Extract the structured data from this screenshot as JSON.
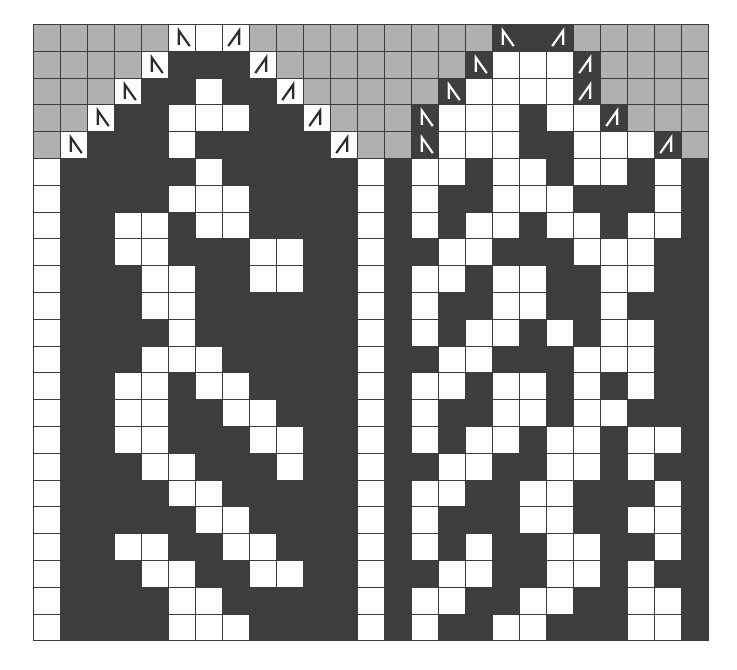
{
  "chart": {
    "columns": 25,
    "rows": 23,
    "colors": {
      "background": "#ffffff",
      "dark_stitch": "#3e3e3e",
      "light_stitch": "#fdfdfd",
      "no_stitch": "#b0b0b0",
      "grid_line": "#3c3c3c",
      "symbol_on_light": "#2b2b2b",
      "symbol_on_dark": "#ffffff"
    },
    "cell_codes": {
      "d": "dark-stitch",
      "w": "light-stitch",
      "g": "no-stitch-gray",
      "wl": "light-stitch-with-left-leaning-decrease",
      "wr": "light-stitch-with-right-leaning-decrease",
      "dl": "dark-stitch-with-left-leaning-decrease",
      "dr": "dark-stitch-with-right-leaning-decrease"
    },
    "symbols": [
      {
        "name": "left-leaning-decrease",
        "code": "wl",
        "glyph": "∧-left"
      },
      {
        "name": "right-leaning-decrease",
        "code": "wr",
        "glyph": "∧-right"
      }
    ],
    "grid": [
      [
        "g",
        "g",
        "g",
        "g",
        "g",
        "wl",
        "w",
        "wr",
        "g",
        "g",
        "g",
        "g",
        "g",
        "g",
        "g",
        "g",
        "g",
        "dl",
        "d",
        "dr",
        "g",
        "g",
        "g",
        "g",
        "g"
      ],
      [
        "g",
        "g",
        "g",
        "g",
        "wl",
        "d",
        "d",
        "d",
        "wr",
        "g",
        "g",
        "g",
        "g",
        "g",
        "g",
        "g",
        "dl",
        "w",
        "w",
        "w",
        "dr",
        "g",
        "g",
        "g",
        "g"
      ],
      [
        "g",
        "g",
        "g",
        "wl",
        "d",
        "d",
        "w",
        "d",
        "d",
        "wr",
        "g",
        "g",
        "g",
        "g",
        "g",
        "dl",
        "w",
        "w",
        "w",
        "w",
        "dr",
        "g",
        "g",
        "g",
        "g"
      ],
      [
        "g",
        "g",
        "wl",
        "d",
        "d",
        "w",
        "w",
        "w",
        "d",
        "d",
        "wr",
        "g",
        "g",
        "g",
        "dl",
        "w",
        "w",
        "w",
        "d",
        "w",
        "w",
        "dr",
        "g",
        "g",
        "g"
      ],
      [
        "g",
        "wl",
        "d",
        "d",
        "d",
        "w",
        "d",
        "d",
        "d",
        "d",
        "d",
        "wr",
        "g",
        "g",
        "dl",
        "w",
        "w",
        "w",
        "d",
        "d",
        "w",
        "w",
        "w",
        "dr",
        "g"
      ],
      [
        "w",
        "d",
        "d",
        "d",
        "d",
        "d",
        "w",
        "d",
        "d",
        "d",
        "d",
        "d",
        "w",
        "d",
        "w",
        "w",
        "d",
        "w",
        "w",
        "d",
        "w",
        "w",
        "d",
        "w",
        "d"
      ],
      [
        "w",
        "d",
        "d",
        "d",
        "d",
        "w",
        "w",
        "w",
        "d",
        "d",
        "d",
        "d",
        "w",
        "d",
        "w",
        "d",
        "d",
        "w",
        "w",
        "w",
        "d",
        "d",
        "d",
        "w",
        "d"
      ],
      [
        "w",
        "d",
        "d",
        "w",
        "w",
        "d",
        "w",
        "w",
        "d",
        "d",
        "d",
        "d",
        "w",
        "d",
        "w",
        "d",
        "w",
        "w",
        "d",
        "w",
        "w",
        "d",
        "w",
        "w",
        "d"
      ],
      [
        "w",
        "d",
        "d",
        "w",
        "w",
        "d",
        "d",
        "d",
        "w",
        "w",
        "d",
        "d",
        "w",
        "d",
        "d",
        "w",
        "w",
        "d",
        "d",
        "d",
        "w",
        "w",
        "w",
        "d",
        "d"
      ],
      [
        "w",
        "d",
        "d",
        "d",
        "w",
        "w",
        "d",
        "d",
        "w",
        "w",
        "d",
        "d",
        "w",
        "d",
        "w",
        "w",
        "d",
        "w",
        "w",
        "d",
        "d",
        "w",
        "w",
        "d",
        "d"
      ],
      [
        "w",
        "d",
        "d",
        "d",
        "w",
        "w",
        "d",
        "d",
        "d",
        "d",
        "d",
        "d",
        "w",
        "d",
        "w",
        "d",
        "d",
        "w",
        "w",
        "d",
        "d",
        "w",
        "d",
        "d",
        "d"
      ],
      [
        "w",
        "d",
        "d",
        "d",
        "d",
        "w",
        "d",
        "d",
        "d",
        "d",
        "d",
        "d",
        "w",
        "d",
        "w",
        "d",
        "w",
        "w",
        "d",
        "w",
        "d",
        "w",
        "w",
        "d",
        "d"
      ],
      [
        "w",
        "d",
        "d",
        "d",
        "w",
        "w",
        "w",
        "d",
        "d",
        "d",
        "d",
        "d",
        "w",
        "d",
        "d",
        "w",
        "w",
        "d",
        "d",
        "d",
        "w",
        "w",
        "w",
        "d",
        "d"
      ],
      [
        "w",
        "d",
        "d",
        "w",
        "w",
        "d",
        "w",
        "w",
        "d",
        "d",
        "d",
        "d",
        "w",
        "d",
        "w",
        "w",
        "d",
        "w",
        "w",
        "d",
        "w",
        "d",
        "w",
        "d",
        "d"
      ],
      [
        "w",
        "d",
        "d",
        "w",
        "w",
        "d",
        "d",
        "w",
        "w",
        "d",
        "d",
        "d",
        "w",
        "d",
        "w",
        "d",
        "d",
        "w",
        "w",
        "d",
        "w",
        "w",
        "d",
        "d",
        "d"
      ],
      [
        "w",
        "d",
        "d",
        "w",
        "w",
        "d",
        "d",
        "d",
        "w",
        "w",
        "d",
        "d",
        "w",
        "d",
        "w",
        "d",
        "w",
        "w",
        "d",
        "w",
        "w",
        "d",
        "w",
        "w",
        "d"
      ],
      [
        "w",
        "d",
        "d",
        "d",
        "w",
        "w",
        "d",
        "d",
        "d",
        "w",
        "d",
        "d",
        "w",
        "d",
        "d",
        "w",
        "w",
        "d",
        "d",
        "w",
        "w",
        "d",
        "w",
        "d",
        "d"
      ],
      [
        "w",
        "d",
        "d",
        "d",
        "d",
        "w",
        "w",
        "d",
        "d",
        "d",
        "d",
        "d",
        "w",
        "d",
        "w",
        "w",
        "d",
        "d",
        "w",
        "w",
        "d",
        "d",
        "d",
        "w",
        "d"
      ],
      [
        "w",
        "d",
        "d",
        "d",
        "d",
        "d",
        "w",
        "w",
        "d",
        "d",
        "d",
        "d",
        "w",
        "d",
        "w",
        "d",
        "d",
        "d",
        "w",
        "w",
        "d",
        "d",
        "w",
        "w",
        "d"
      ],
      [
        "w",
        "d",
        "d",
        "w",
        "w",
        "d",
        "d",
        "w",
        "w",
        "d",
        "d",
        "d",
        "w",
        "d",
        "w",
        "d",
        "w",
        "d",
        "d",
        "w",
        "w",
        "d",
        "d",
        "w",
        "d"
      ],
      [
        "w",
        "d",
        "d",
        "d",
        "w",
        "w",
        "d",
        "d",
        "w",
        "w",
        "d",
        "d",
        "w",
        "d",
        "d",
        "w",
        "w",
        "d",
        "d",
        "w",
        "w",
        "d",
        "w",
        "d",
        "d"
      ],
      [
        "w",
        "d",
        "d",
        "d",
        "d",
        "w",
        "w",
        "d",
        "d",
        "d",
        "d",
        "d",
        "w",
        "d",
        "w",
        "w",
        "d",
        "d",
        "w",
        "w",
        "d",
        "d",
        "w",
        "w",
        "d"
      ],
      [
        "w",
        "d",
        "d",
        "d",
        "d",
        "w",
        "w",
        "w",
        "d",
        "d",
        "d",
        "d",
        "w",
        "d",
        "w",
        "d",
        "d",
        "w",
        "w",
        "d",
        "d",
        "d",
        "w",
        "w",
        "d"
      ]
    ]
  }
}
